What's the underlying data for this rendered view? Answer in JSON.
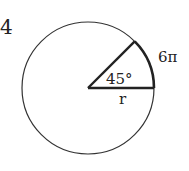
{
  "problem_number": "4",
  "diagram": {
    "angle_label": "45°",
    "arc_label": "6π",
    "radius_label": "r",
    "stroke_color": "#333333",
    "background": "#ffffff"
  }
}
